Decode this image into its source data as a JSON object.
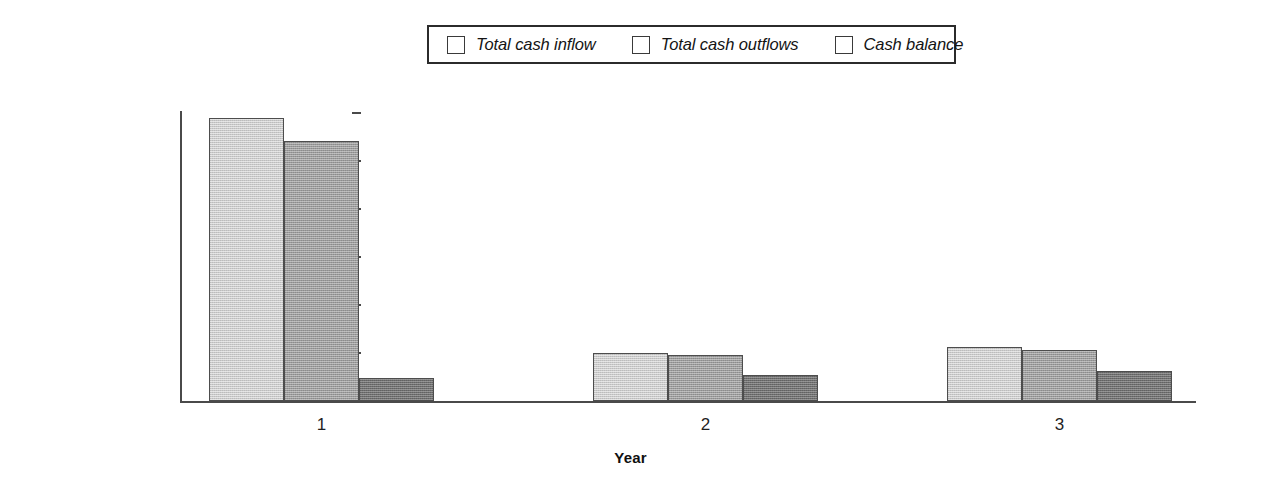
{
  "chart_data": {
    "type": "bar",
    "title": "",
    "xlabel": "Year",
    "ylabel": "",
    "categories": [
      "1",
      "2",
      "3"
    ],
    "series": [
      {
        "name": "Total cash inflow",
        "values": [
          11800000,
          2020000,
          2230000
        ],
        "color": "#cacaca"
      },
      {
        "name": "Total cash outflows",
        "values": [
          10850000,
          1910000,
          2110000
        ],
        "color": "#9b9b9b"
      },
      {
        "name": "Cash balance",
        "values": [
          940000,
          1080000,
          1250000
        ],
        "color": "#6f6f6f"
      }
    ],
    "ylim": [
      0,
      12000000
    ],
    "ytick_values": [
      0,
      2000000,
      4000000,
      6000000,
      8000000,
      10000000,
      12000000
    ],
    "ytick_labels": [
      "$0",
      "$2,000,000",
      "$4,000,000",
      "$6,000,000",
      "$8,000,000",
      "$10,000,000",
      "$12,000,000"
    ],
    "grid": false,
    "legend_position": "top-center",
    "axis_color": "#4a4a4a",
    "bar_border_color": "#4d4d4d"
  },
  "legend": {
    "entries": [
      {
        "label": "Total cash inflow"
      },
      {
        "label": "Total cash outflows"
      },
      {
        "label": "Cash balance"
      }
    ]
  },
  "axes": {
    "x_title": "Year",
    "x_labels": [
      "1",
      "2",
      "3"
    ],
    "y_labels": [
      "$12,000,000",
      "$10,000,000",
      "$8,000,000",
      "$6,000,000",
      "$4,000,000",
      "$2,000,000",
      "$0"
    ]
  }
}
